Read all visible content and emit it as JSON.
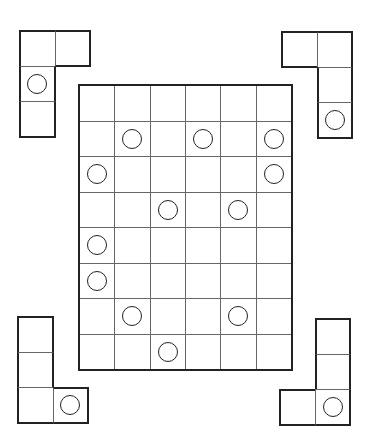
{
  "puzzle": {
    "type": "grid-placement-puzzle",
    "main_grid": {
      "rows": 8,
      "cols": 6,
      "x": 79,
      "y": 85,
      "cell_w": 35.33,
      "cell_h": 35.5,
      "circles": [
        [
          1,
          1
        ],
        [
          1,
          3
        ],
        [
          1,
          5
        ],
        [
          2,
          0
        ],
        [
          2,
          5
        ],
        [
          3,
          2
        ],
        [
          3,
          4
        ],
        [
          4,
          0
        ],
        [
          5,
          0
        ],
        [
          6,
          1
        ],
        [
          6,
          4
        ],
        [
          7,
          2
        ]
      ]
    },
    "pieces": [
      {
        "name": "piece-top-left",
        "x": 19,
        "y": 30,
        "cell": 35.5,
        "cells": [
          [
            0,
            0
          ],
          [
            0,
            1
          ],
          [
            1,
            0
          ],
          [
            2,
            0
          ]
        ],
        "circles": [
          [
            1,
            0
          ]
        ]
      },
      {
        "name": "piece-top-right",
        "x": 281,
        "y": 31,
        "cell": 35.7,
        "cells": [
          [
            0,
            0
          ],
          [
            0,
            1
          ],
          [
            1,
            1
          ],
          [
            2,
            1
          ]
        ],
        "circles": [
          [
            2,
            1
          ]
        ]
      },
      {
        "name": "piece-bottom-left",
        "x": 17,
        "y": 316,
        "cell": 35.5,
        "cells": [
          [
            0,
            0
          ],
          [
            1,
            0
          ],
          [
            2,
            0
          ],
          [
            2,
            1
          ]
        ],
        "circles": [
          [
            2,
            1
          ]
        ]
      },
      {
        "name": "piece-bottom-right",
        "x": 279,
        "y": 318,
        "cell": 35.7,
        "cells": [
          [
            0,
            1
          ],
          [
            1,
            1
          ],
          [
            2,
            0
          ],
          [
            2,
            1
          ]
        ],
        "circles": [
          [
            2,
            1
          ]
        ]
      }
    ],
    "colors": {
      "line": "#666666",
      "border": "#222222",
      "circle": "#222222",
      "background": "#ffffff"
    }
  }
}
